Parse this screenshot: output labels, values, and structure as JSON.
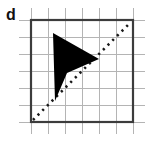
{
  "figure": {
    "label": "d",
    "colors": {
      "background": "#ffffff",
      "grid_line": "#b4b4b4",
      "border": "#3c3c3c",
      "shape_fill": "#000000",
      "dashed_line": "#1a1a1a",
      "label_color": "#111111"
    },
    "grid": {
      "cell_size": 17,
      "origin_x": 31,
      "origin_y": 20,
      "columns": 6,
      "rows": 6,
      "overhang": 12,
      "vertical_line_count": 7,
      "horizontal_line_count": 7
    },
    "border_box": {
      "x": 31,
      "y": 20,
      "width": 102,
      "height": 102,
      "stroke_width": 2.2
    },
    "mirror_line": {
      "x1": 33,
      "y1": 120,
      "x2": 131,
      "y2": 22,
      "dash": "2.2 4.4",
      "stroke_width": 2.6
    },
    "shape": {
      "name": "dart",
      "points": "53,33 99,59 67,73 55,101"
    }
  }
}
